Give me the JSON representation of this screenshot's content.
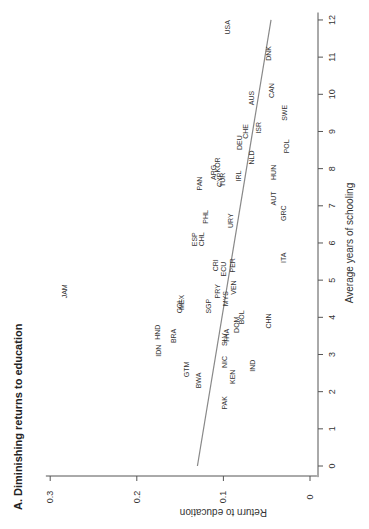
{
  "chart_data": {
    "type": "scatter",
    "title": "A. Diminishing returns to education",
    "xlabel": "Average years of schooling",
    "ylabel": "Return to education",
    "xlim": [
      0,
      12
    ],
    "ylim": [
      0,
      0.3
    ],
    "xticks": [
      0,
      1,
      2,
      3,
      4,
      5,
      6,
      7,
      8,
      9,
      10,
      11,
      12
    ],
    "yticks": [
      0,
      0.1,
      0.2,
      0.3
    ],
    "ytick_labels": [
      "0",
      "0.1",
      "0.2",
      "0.3"
    ],
    "grid": false,
    "orientation": "rotated 90 degrees counterclockwise",
    "fit_line": {
      "x": [
        0,
        12
      ],
      "y": [
        0.13,
        0.045
      ],
      "color": "#888888"
    },
    "points": [
      {
        "label": "USA",
        "x": 11.8,
        "y": 0.095
      },
      {
        "label": "DNK",
        "x": 11.1,
        "y": 0.048
      },
      {
        "label": "CAN",
        "x": 10.1,
        "y": 0.045
      },
      {
        "label": "AUS",
        "x": 9.9,
        "y": 0.068
      },
      {
        "label": "SWE",
        "x": 9.5,
        "y": 0.029
      },
      {
        "label": "ISR",
        "x": 9.1,
        "y": 0.06
      },
      {
        "label": "CHE",
        "x": 9.0,
        "y": 0.075
      },
      {
        "label": "DEU",
        "x": 8.7,
        "y": 0.081
      },
      {
        "label": "POL",
        "x": 8.6,
        "y": 0.027
      },
      {
        "label": "NLD",
        "x": 8.3,
        "y": 0.068
      },
      {
        "label": "KOR",
        "x": 8.1,
        "y": 0.107
      },
      {
        "label": "ARG",
        "x": 7.9,
        "y": 0.112
      },
      {
        "label": "HUN",
        "x": 7.9,
        "y": 0.042
      },
      {
        "label": "IRL",
        "x": 7.8,
        "y": 0.082
      },
      {
        "label": "CYP",
        "x": 7.7,
        "y": 0.104
      },
      {
        "label": "TUR",
        "x": 7.7,
        "y": 0.101
      },
      {
        "label": "PAN",
        "x": 7.6,
        "y": 0.128
      },
      {
        "label": "AUT",
        "x": 7.2,
        "y": 0.042
      },
      {
        "label": "GRC",
        "x": 6.8,
        "y": 0.031
      },
      {
        "label": "PHL",
        "x": 6.7,
        "y": 0.121
      },
      {
        "label": "URY",
        "x": 6.6,
        "y": 0.092
      },
      {
        "label": "ESP",
        "x": 6.1,
        "y": 0.133
      },
      {
        "label": "CHL",
        "x": 6.1,
        "y": 0.125
      },
      {
        "label": "ITA",
        "x": 5.6,
        "y": 0.031
      },
      {
        "label": "CRI",
        "x": 5.4,
        "y": 0.109
      },
      {
        "label": "PER",
        "x": 5.4,
        "y": 0.089
      },
      {
        "label": "ECU",
        "x": 5.3,
        "y": 0.1
      },
      {
        "label": "VEN",
        "x": 4.8,
        "y": 0.088
      },
      {
        "label": "PRY",
        "x": 4.7,
        "y": 0.107
      },
      {
        "label": "JAM",
        "x": 4.7,
        "y": 0.283
      },
      {
        "label": "MYS",
        "x": 4.5,
        "y": 0.097
      },
      {
        "label": "MEX",
        "x": 4.4,
        "y": 0.148
      },
      {
        "label": "COL",
        "x": 4.3,
        "y": 0.151
      },
      {
        "label": "SGP",
        "x": 4.3,
        "y": 0.117
      },
      {
        "label": "BOL",
        "x": 4.0,
        "y": 0.079
      },
      {
        "label": "CHN",
        "x": 3.9,
        "y": 0.048
      },
      {
        "label": "DOM",
        "x": 3.8,
        "y": 0.085
      },
      {
        "label": "HND",
        "x": 3.6,
        "y": 0.176
      },
      {
        "label": "BRA",
        "x": 3.5,
        "y": 0.158
      },
      {
        "label": "THA",
        "x": 3.5,
        "y": 0.096
      },
      {
        "label": "SLV",
        "x": 3.4,
        "y": 0.099
      },
      {
        "label": "IDN",
        "x": 3.1,
        "y": 0.175
      },
      {
        "label": "NIC",
        "x": 2.8,
        "y": 0.099
      },
      {
        "label": "IND",
        "x": 2.7,
        "y": 0.066
      },
      {
        "label": "GTM",
        "x": 2.6,
        "y": 0.143
      },
      {
        "label": "KEN",
        "x": 2.4,
        "y": 0.089
      },
      {
        "label": "BWA",
        "x": 2.3,
        "y": 0.129
      },
      {
        "label": "PAK",
        "x": 1.7,
        "y": 0.099
      }
    ]
  }
}
